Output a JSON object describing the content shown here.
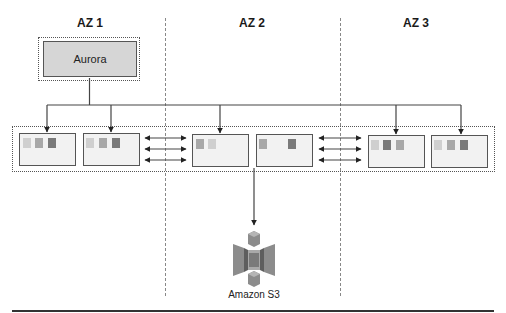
{
  "diagram": {
    "zones": [
      {
        "label": "AZ 1"
      },
      {
        "label": "AZ 2"
      },
      {
        "label": "AZ 3"
      }
    ],
    "primary": {
      "label": "Aurora"
    },
    "storage": {
      "label": "Amazon S3",
      "icon": "s3-bucket-icon"
    },
    "nodes": [
      {
        "zone": "AZ 1",
        "blocks": [
          "#cfcfcf",
          "#a8a8a8",
          "#7a7a7a"
        ]
      },
      {
        "zone": "AZ 1",
        "blocks": [
          "#cfcfcf",
          "#a8a8a8",
          "#7a7a7a"
        ]
      },
      {
        "zone": "AZ 2",
        "blocks": [
          "#a8a8a8",
          "#cfcfcf"
        ]
      },
      {
        "zone": "AZ 2",
        "blocks": [
          "#a8a8a8",
          "#7a7a7a"
        ]
      },
      {
        "zone": "AZ 3",
        "blocks": [
          "#cfcfcf",
          "#7a7a7a",
          "#a8a8a8"
        ]
      },
      {
        "zone": "AZ 3",
        "blocks": [
          "#cfcfcf",
          "#a8a8a8",
          "#7a7a7a"
        ]
      }
    ],
    "colors": {
      "line": "#444444",
      "divider": "#888888",
      "node_bg": "#f2f2f2",
      "aurora_bg": "#d6d6d6",
      "s3_light": "#a9a9a9",
      "s3_mid": "#8c8c8c",
      "s3_dark": "#5e5e5e"
    }
  }
}
